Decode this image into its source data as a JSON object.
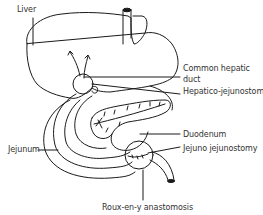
{
  "diagram": {
    "type": "anatomical illustration",
    "stroke_color": "#1a1a1a",
    "background": "#ffffff",
    "labels": {
      "liver": "Liver",
      "common_hepatic_duct_line1": "Common hepatic",
      "common_hepatic_duct_line2": "duct",
      "hepatico_jejunostomy": "Hepatico-jejunostomy",
      "duodenum": "Duodenum",
      "jejunum": "Jejunum",
      "jejuno_jejunostomy": "Jejuno jejunostomy",
      "roux_en_y_anastomosis": "Roux-en-y anastomosis"
    }
  }
}
